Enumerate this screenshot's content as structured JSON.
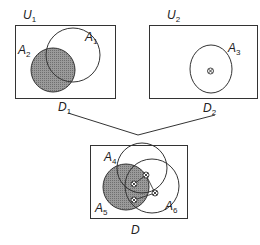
{
  "colors": {
    "stroke": "#333333",
    "fill_shaded": "#8a8a8a",
    "background": "#ffffff"
  },
  "domains": {
    "u1": {
      "label": "U",
      "sub": "1",
      "caption": "D",
      "caption_sub": "1",
      "sets": [
        {
          "label": "A",
          "sub": "1",
          "shaded": false
        },
        {
          "label": "A",
          "sub": "2",
          "shaded": true
        }
      ]
    },
    "u2": {
      "label": "U",
      "sub": "2",
      "caption": "D",
      "caption_sub": "2",
      "sets": [
        {
          "label": "A",
          "sub": "3",
          "shaded": false
        }
      ],
      "marker": "⊗"
    },
    "d": {
      "caption": "D",
      "sets": [
        {
          "label": "A",
          "sub": "4",
          "shaded": false
        },
        {
          "label": "A",
          "sub": "5",
          "shaded": true
        },
        {
          "label": "A",
          "sub": "6",
          "shaded": false
        }
      ],
      "markers": [
        "⊗",
        "⊗",
        "⊗",
        "⊗"
      ]
    }
  }
}
